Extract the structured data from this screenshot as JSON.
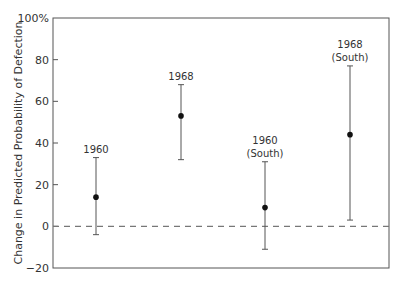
{
  "chart_data": {
    "type": "scatter",
    "subtype": "point-with-error-bars",
    "title": "",
    "xlabel": "",
    "ylabel": "Change in Predicted Probability of Defection",
    "ylim": [
      -20,
      100
    ],
    "yticks": [
      -20,
      0,
      20,
      40,
      60,
      80,
      100
    ],
    "ytick_labels": [
      "−20",
      "0",
      "20",
      "40",
      "60",
      "80",
      "100%"
    ],
    "grid": false,
    "reference_line": {
      "y": 0,
      "style": "dashed"
    },
    "points": [
      {
        "label_line1": "1960",
        "label_line2": "",
        "estimate": 14,
        "lower": -4,
        "upper": 33
      },
      {
        "label_line1": "1968",
        "label_line2": "",
        "estimate": 53,
        "lower": 32,
        "upper": 68
      },
      {
        "label_line1": "1960",
        "label_line2": "(South)",
        "estimate": 9,
        "lower": -11,
        "upper": 31
      },
      {
        "label_line1": "1968",
        "label_line2": "(South)",
        "estimate": 44,
        "lower": 3,
        "upper": 77
      }
    ]
  }
}
